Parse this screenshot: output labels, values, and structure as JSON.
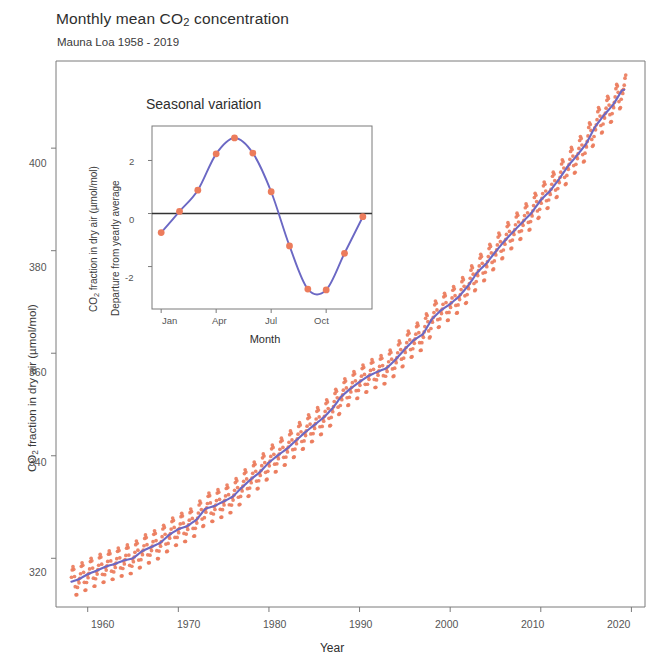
{
  "header": {
    "subtitle": "Mauna Loa 1958 - 2019"
  },
  "main_axis": {
    "ylabel": "CO₂ fraction in dry air (µmol/mol)",
    "xlabel": "Year",
    "yticks": [
      "320",
      "340",
      "360",
      "380",
      "400"
    ],
    "xticks": [
      "1960",
      "1970",
      "1980",
      "1990",
      "2000",
      "2010",
      "2020"
    ]
  },
  "inset_axis": {
    "title": "Seasonal variation",
    "ylabel_line1": "CO₂ fraction in dry air (µmol/mol)",
    "ylabel_line2": "Departure from yearly average",
    "xlabel": "Month",
    "yticks": [
      "-2",
      "0",
      "2"
    ],
    "xticks": [
      "Jan",
      "Apr",
      "Jul",
      "Oct"
    ]
  },
  "colors": {
    "points": "#ec7c5c",
    "line": "#6b68c4",
    "axis": "#7a7a7a",
    "zero_line": "#333333",
    "text": "#3a3a3a"
  },
  "chart_data": {
    "type": "scatter",
    "title": "Monthly mean CO2 concentration",
    "subtitle": "Mauna Loa 1958 - 2019",
    "xlabel": "Year",
    "ylabel": "CO2 fraction in dry air (umol/mol)",
    "xlim": [
      1956.5,
      2021.5
    ],
    "ylim": [
      310.5,
      417.0
    ],
    "xticks": [
      1960,
      1970,
      1980,
      1990,
      2000,
      2010,
      2020
    ],
    "yticks": [
      320,
      340,
      360,
      380,
      400
    ],
    "grid": false,
    "legend": "none",
    "series": [
      {
        "name": "Monthly mean",
        "kind": "scatter",
        "marker": "circle",
        "color": "#ec7c5c",
        "note": "Monthly mean CO2 values; annual sawtooth of about +/- 3 umol/mol superimposed on the trend.",
        "x_start": 1958.2,
        "x_end": 2019.4,
        "sampling": "monthly",
        "annual_amplitude": 3.0,
        "annual_values_trend": [
          {
            "year": 1958,
            "value": 315.3
          },
          {
            "year": 1959,
            "value": 315.9
          },
          {
            "year": 1960,
            "value": 316.9
          },
          {
            "year": 1961,
            "value": 317.6
          },
          {
            "year": 1962,
            "value": 318.4
          },
          {
            "year": 1963,
            "value": 318.9
          },
          {
            "year": 1964,
            "value": 319.6
          },
          {
            "year": 1965,
            "value": 320.0
          },
          {
            "year": 1966,
            "value": 321.4
          },
          {
            "year": 1967,
            "value": 322.2
          },
          {
            "year": 1968,
            "value": 323.0
          },
          {
            "year": 1969,
            "value": 324.6
          },
          {
            "year": 1970,
            "value": 325.7
          },
          {
            "year": 1971,
            "value": 326.3
          },
          {
            "year": 1972,
            "value": 327.5
          },
          {
            "year": 1973,
            "value": 329.7
          },
          {
            "year": 1974,
            "value": 330.2
          },
          {
            "year": 1975,
            "value": 331.1
          },
          {
            "year": 1976,
            "value": 332.0
          },
          {
            "year": 1977,
            "value": 333.8
          },
          {
            "year": 1978,
            "value": 335.4
          },
          {
            "year": 1979,
            "value": 336.8
          },
          {
            "year": 1980,
            "value": 338.7
          },
          {
            "year": 1981,
            "value": 340.1
          },
          {
            "year": 1982,
            "value": 341.4
          },
          {
            "year": 1983,
            "value": 343.0
          },
          {
            "year": 1984,
            "value": 344.6
          },
          {
            "year": 1985,
            "value": 346.0
          },
          {
            "year": 1986,
            "value": 347.4
          },
          {
            "year": 1987,
            "value": 349.2
          },
          {
            "year": 1988,
            "value": 351.6
          },
          {
            "year": 1989,
            "value": 353.1
          },
          {
            "year": 1990,
            "value": 354.4
          },
          {
            "year": 1991,
            "value": 355.6
          },
          {
            "year": 1992,
            "value": 356.4
          },
          {
            "year": 1993,
            "value": 357.1
          },
          {
            "year": 1994,
            "value": 358.8
          },
          {
            "year": 1995,
            "value": 360.8
          },
          {
            "year": 1996,
            "value": 362.6
          },
          {
            "year": 1997,
            "value": 363.7
          },
          {
            "year": 1998,
            "value": 366.7
          },
          {
            "year": 1999,
            "value": 368.4
          },
          {
            "year": 2000,
            "value": 369.6
          },
          {
            "year": 2001,
            "value": 371.1
          },
          {
            "year": 2002,
            "value": 373.2
          },
          {
            "year": 2003,
            "value": 375.8
          },
          {
            "year": 2004,
            "value": 377.5
          },
          {
            "year": 2005,
            "value": 379.8
          },
          {
            "year": 2006,
            "value": 381.9
          },
          {
            "year": 2007,
            "value": 383.8
          },
          {
            "year": 2008,
            "value": 385.6
          },
          {
            "year": 2009,
            "value": 387.4
          },
          {
            "year": 2010,
            "value": 389.9
          },
          {
            "year": 2011,
            "value": 391.6
          },
          {
            "year": 2012,
            "value": 393.9
          },
          {
            "year": 2013,
            "value": 396.5
          },
          {
            "year": 2014,
            "value": 398.6
          },
          {
            "year": 2015,
            "value": 400.8
          },
          {
            "year": 2016,
            "value": 404.2
          },
          {
            "year": 2017,
            "value": 406.5
          },
          {
            "year": 2018,
            "value": 408.5
          },
          {
            "year": 2019,
            "value": 411.4
          }
        ]
      },
      {
        "name": "Smoothed trend",
        "kind": "line",
        "color": "#6b68c4",
        "note": "Blue smooth curve through the monthly means (trend, seasonality removed)."
      }
    ],
    "inset": {
      "type": "line",
      "title": "Seasonal variation",
      "xlabel": "Month",
      "ylabel": "Departure from yearly average",
      "ylabel_units": "CO2 fraction in dry air (umol/mol)",
      "xticks": [
        "Jan",
        "Apr",
        "Jul",
        "Oct"
      ],
      "xtick_months": [
        1,
        4,
        7,
        10
      ],
      "yticks": [
        -2,
        0,
        2
      ],
      "ylim": [
        -3.6,
        3.3
      ],
      "xlim": [
        0.5,
        12.5
      ],
      "zero_line": true,
      "categories": [
        "Jan",
        "Feb",
        "Mar",
        "Apr",
        "May",
        "Jun",
        "Jul",
        "Aug",
        "Sep",
        "Oct",
        "Nov",
        "Dec"
      ],
      "values": [
        -0.72,
        0.08,
        0.88,
        2.25,
        2.85,
        2.28,
        0.82,
        -1.22,
        -2.85,
        -2.88,
        -1.5,
        -0.12
      ],
      "marker": "circle",
      "marker_color": "#ec7c5c",
      "line_color": "#6b68c4"
    }
  }
}
